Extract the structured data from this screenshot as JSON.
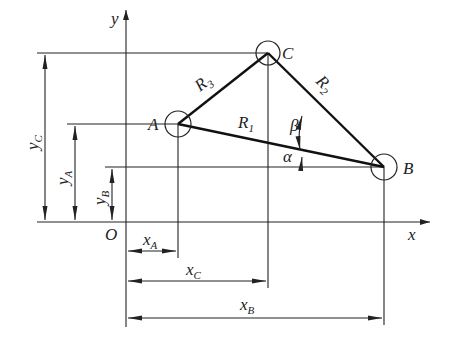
{
  "figure": {
    "type": "kinematic-coordinate-diagram"
  },
  "axes": {
    "x_label": "x",
    "y_label": "y",
    "origin_label": "O"
  },
  "points": [
    {
      "label": "A"
    },
    {
      "label": "B"
    },
    {
      "label": "C"
    }
  ],
  "links": [
    {
      "label": "R",
      "sub": "1",
      "from": "A",
      "to": "B"
    },
    {
      "label": "R",
      "sub": "2",
      "from": "C",
      "to": "B"
    },
    {
      "label": "R",
      "sub": "3",
      "from": "A",
      "to": "C"
    }
  ],
  "angles": [
    {
      "label": "α"
    },
    {
      "label": "β"
    }
  ],
  "dimensions": {
    "x": [
      {
        "label": "x",
        "sub": "A"
      },
      {
        "label": "x",
        "sub": "C"
      },
      {
        "label": "x",
        "sub": "B"
      }
    ],
    "y": [
      {
        "label": "y",
        "sub": "C"
      },
      {
        "label": "y",
        "sub": "A"
      },
      {
        "label": "y",
        "sub": "B"
      }
    ]
  }
}
